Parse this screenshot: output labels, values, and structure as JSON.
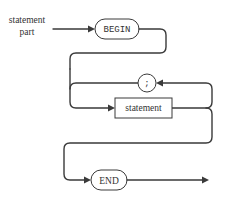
{
  "diagram": {
    "type": "syntax-diagram",
    "entry_label_line1": "statement",
    "entry_label_line2": "part",
    "nodes": [
      {
        "id": "begin",
        "kind": "terminal",
        "label": "BEGIN"
      },
      {
        "id": "semicolon",
        "kind": "terminal",
        "label": ";"
      },
      {
        "id": "statement",
        "kind": "nonterminal",
        "label": "statement"
      },
      {
        "id": "end",
        "kind": "terminal",
        "label": "END"
      }
    ],
    "edges": [
      {
        "from": "start",
        "to": "begin"
      },
      {
        "from": "begin",
        "to": "statement"
      },
      {
        "from": "statement",
        "to": "semicolon",
        "note": "loop back"
      },
      {
        "from": "semicolon",
        "to": "statement"
      },
      {
        "from": "statement",
        "to": "end"
      },
      {
        "from": "end",
        "to": "exit"
      }
    ],
    "colors": {
      "stroke": "#3a3a3a",
      "fill": "#ffffff",
      "text": "#333333"
    }
  }
}
